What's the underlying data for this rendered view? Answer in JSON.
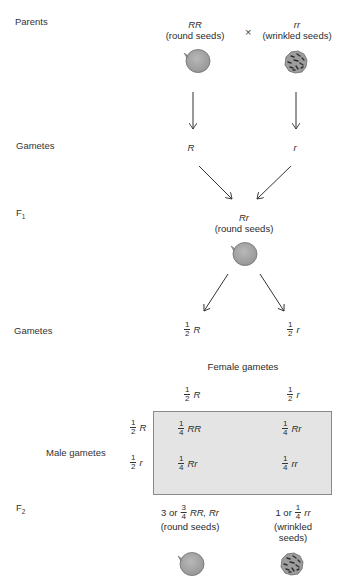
{
  "rows": {
    "parents": "Parents",
    "gametes1": "Gametes",
    "f1": "F",
    "f1_sub": "1",
    "gametes2": "Gametes",
    "f2": "F",
    "f2_sub": "2"
  },
  "parents": {
    "left": {
      "genotype": "RR",
      "phenotype": "(round seeds)",
      "seed": "round-seed"
    },
    "cross_symbol": "×",
    "right": {
      "genotype": "rr",
      "phenotype": "(wrinkled seeds)",
      "seed": "wrinkled-seed"
    }
  },
  "gametes1": {
    "left": "R",
    "right": "r"
  },
  "f1": {
    "genotype": "Rr",
    "phenotype": "(round seeds)",
    "seed": "round-seed"
  },
  "gametes2": {
    "left": {
      "num": "1",
      "den": "2",
      "allele": "R"
    },
    "right": {
      "num": "1",
      "den": "2",
      "allele": "r"
    }
  },
  "punnett": {
    "female_label": "Female gametes",
    "male_label": "Male gametes",
    "female": [
      {
        "num": "1",
        "den": "2",
        "allele": "R"
      },
      {
        "num": "1",
        "den": "2",
        "allele": "r"
      }
    ],
    "male": [
      {
        "num": "1",
        "den": "2",
        "allele": "R"
      },
      {
        "num": "1",
        "den": "2",
        "allele": "r"
      }
    ],
    "cells": [
      [
        {
          "num": "1",
          "den": "4",
          "genotype": "RR"
        },
        {
          "num": "1",
          "den": "4",
          "genotype": "Rr"
        }
      ],
      [
        {
          "num": "1",
          "den": "4",
          "genotype": "Rr"
        },
        {
          "num": "1",
          "den": "4",
          "genotype": "rr"
        }
      ]
    ],
    "fill_color": "#e4e4e4"
  },
  "f2": {
    "left": {
      "count": "3 or",
      "num": "3",
      "den": "4",
      "genotype": "RR, Rr",
      "phenotype": "(round seeds)",
      "seed": "round-seed"
    },
    "right": {
      "count": "1 or",
      "num": "1",
      "den": "4",
      "genotype": "rr",
      "phenotype": "(wrinkled seeds)",
      "seed": "wrinkled-seed"
    }
  },
  "colors": {
    "seed_fill": "#a9a9a9",
    "seed_edge": "#6e6e6e",
    "arrow": "#333333"
  }
}
